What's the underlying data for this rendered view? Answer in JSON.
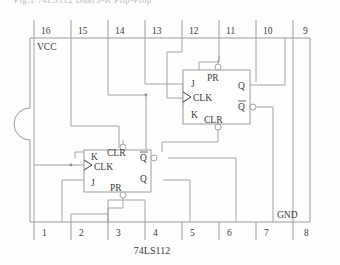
{
  "figure": {
    "part_name": "74LS112",
    "cropped_header_text": "Fig.1 74LS112 Dual J-K Flip-Flop",
    "supply_label": "VCC",
    "ground_label": "GND"
  },
  "pins": {
    "top_row": [
      {
        "number": "16",
        "x": 45
      },
      {
        "number": "15",
        "x": 81
      },
      {
        "number": "14",
        "x": 118
      },
      {
        "number": "13",
        "x": 155
      },
      {
        "number": "12",
        "x": 192
      },
      {
        "number": "11",
        "x": 229
      },
      {
        "number": "10",
        "x": 266
      },
      {
        "number": "9",
        "x": 303
      }
    ],
    "bottom_row": [
      {
        "number": "1",
        "x": 45
      },
      {
        "number": "2",
        "x": 81
      },
      {
        "number": "3",
        "x": 118
      },
      {
        "number": "4",
        "x": 155
      },
      {
        "number": "5",
        "x": 192
      },
      {
        "number": "6",
        "x": 229
      },
      {
        "number": "7",
        "x": 266
      },
      {
        "number": "8",
        "x": 303
      }
    ]
  },
  "flip_flops": [
    {
      "id": "ff-upper",
      "labels": {
        "j": "J",
        "k": "K",
        "clk": "CLK",
        "preset": "PR",
        "clear": "CLR",
        "q": "Q",
        "q_bar": "Q"
      }
    },
    {
      "id": "ff-lower",
      "labels": {
        "j": "J",
        "k": "K",
        "clk": "CLK",
        "preset": "PR",
        "clear": "CLR",
        "q": "Q",
        "q_bar": "Q"
      }
    }
  ],
  "colors": {
    "wire": "#8d8d8d",
    "outline": "#9a9a9a",
    "text": "#3a3a3a",
    "background": "#fefefe"
  }
}
